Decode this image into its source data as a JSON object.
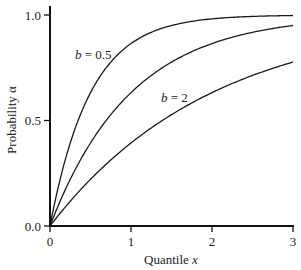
{
  "chart_data": {
    "type": "line",
    "title": "",
    "xlabel": "Quantile x",
    "ylabel": "Probability α",
    "xlim": [
      0,
      3
    ],
    "ylim": [
      0,
      1
    ],
    "x_ticks": [
      "0",
      "1",
      "2",
      "3"
    ],
    "y_ticks": [
      "0.0",
      "0.5",
      "1.0"
    ],
    "grid": false,
    "legend": "inline labels",
    "formula": "α = 1 − exp(−x / b)",
    "x": [
      0,
      0.25,
      0.5,
      0.75,
      1.0,
      1.25,
      1.5,
      1.75,
      2.0,
      2.25,
      2.5,
      2.75,
      3.0
    ],
    "series": [
      {
        "name": "b = 0.5",
        "b": 0.5,
        "values": [
          0,
          0.39,
          0.63,
          0.78,
          0.86,
          0.92,
          0.95,
          0.97,
          0.98,
          0.99,
          0.99,
          1.0,
          1.0
        ]
      },
      {
        "name": "b = 1",
        "b": 1,
        "values": [
          0,
          0.22,
          0.39,
          0.53,
          0.63,
          0.71,
          0.78,
          0.83,
          0.86,
          0.89,
          0.92,
          0.94,
          0.95
        ]
      },
      {
        "name": "b = 2",
        "b": 2,
        "values": [
          0,
          0.12,
          0.22,
          0.31,
          0.39,
          0.46,
          0.53,
          0.58,
          0.63,
          0.68,
          0.71,
          0.75,
          0.78
        ]
      }
    ],
    "annotations": [
      {
        "text": "b = 0.5",
        "x": 0.55,
        "y": 0.78
      },
      {
        "text": "b = 2",
        "x": 1.4,
        "y": 0.63
      }
    ]
  },
  "labels": {
    "xlabel_main": "Quantile ",
    "xlabel_var": "x",
    "ylabel": "Probability α",
    "b05_var": "b",
    "b05_rest": " = 0.5",
    "b2_var": "b",
    "b2_rest": " = 2"
  }
}
